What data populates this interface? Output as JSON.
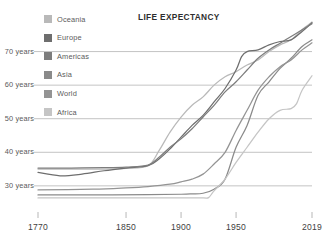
{
  "chart_data": {
    "type": "line",
    "title": "LIFE EXPECTANCY",
    "xlabel": "",
    "ylabel": "",
    "xlim": [
      1770,
      2019
    ],
    "ylim": [
      24,
      80
    ],
    "grid": true,
    "legend_position": "top-left",
    "x_ticks": [
      1770,
      1850,
      1900,
      1950,
      2019
    ],
    "x_tick_labels": [
      "1770",
      "1850",
      "1900",
      "1950",
      "2019"
    ],
    "y_ticks": [
      30,
      40,
      50,
      60,
      70
    ],
    "y_tick_labels": [
      "30 years",
      "40 years",
      "50 years",
      "60 years",
      "70 years"
    ],
    "series": [
      {
        "name": "Oceania",
        "color": "#b9b9b9",
        "x": [
          1770,
          1800,
          1830,
          1850,
          1870,
          1880,
          1890,
          1900,
          1910,
          1920,
          1930,
          1940,
          1950,
          1960,
          1970,
          1980,
          1990,
          2000,
          2010,
          2019
        ],
        "values": [
          35.0,
          35.0,
          35.0,
          35.2,
          36.0,
          40.5,
          46.0,
          50.5,
          54.0,
          56.5,
          60.0,
          62.5,
          64.0,
          66.0,
          67.5,
          70.0,
          72.0,
          73.5,
          76.5,
          78.8
        ]
      },
      {
        "name": "Europe",
        "color": "#6e6e6e",
        "x": [
          1770,
          1790,
          1810,
          1830,
          1850,
          1870,
          1880,
          1890,
          1900,
          1910,
          1920,
          1930,
          1940,
          1950,
          1955,
          1960,
          1970,
          1980,
          1990,
          2000,
          2010,
          2019
        ],
        "values": [
          34.0,
          33.0,
          33.5,
          34.5,
          35.3,
          36.0,
          38.0,
          41.0,
          44.5,
          48.0,
          51.0,
          55.0,
          59.0,
          64.5,
          68.5,
          70.0,
          70.5,
          72.0,
          73.0,
          73.5,
          76.0,
          78.6
        ]
      },
      {
        "name": "Americas",
        "color": "#7d7d7d",
        "x": [
          1770,
          1800,
          1830,
          1850,
          1870,
          1880,
          1890,
          1900,
          1910,
          1920,
          1930,
          1940,
          1950,
          1960,
          1970,
          1980,
          1990,
          2000,
          2010,
          2019
        ],
        "values": [
          35.3,
          35.3,
          35.4,
          35.6,
          36.2,
          38.5,
          41.5,
          44.0,
          47.0,
          50.5,
          54.0,
          58.0,
          61.0,
          64.5,
          68.0,
          70.5,
          72.5,
          74.5,
          76.5,
          78.3
        ]
      },
      {
        "name": "Asia",
        "color": "#8a8a8a",
        "x": [
          1770,
          1820,
          1870,
          1900,
          1910,
          1920,
          1930,
          1940,
          1950,
          1960,
          1970,
          1980,
          1990,
          2000,
          2010,
          2019
        ],
        "values": [
          27.3,
          27.3,
          27.4,
          27.5,
          27.6,
          27.8,
          29.0,
          32.0,
          41.5,
          48.0,
          57.0,
          61.0,
          65.0,
          68.0,
          71.5,
          73.5
        ]
      },
      {
        "name": "World",
        "color": "#949494",
        "x": [
          1770,
          1820,
          1850,
          1870,
          1890,
          1900,
          1910,
          1920,
          1930,
          1940,
          1950,
          1960,
          1970,
          1980,
          1990,
          2000,
          2010,
          2019
        ],
        "values": [
          28.8,
          29.0,
          29.4,
          29.8,
          30.5,
          31.2,
          32.0,
          33.5,
          36.5,
          40.0,
          46.5,
          52.5,
          58.5,
          62.5,
          65.5,
          67.5,
          70.5,
          72.6
        ]
      },
      {
        "name": "Africa",
        "color": "#c5c5c5",
        "x": [
          1770,
          1850,
          1900,
          1920,
          1925,
          1930,
          1940,
          1950,
          1960,
          1970,
          1980,
          1990,
          2000,
          2005,
          2010,
          2019
        ],
        "values": [
          26.4,
          26.4,
          26.4,
          26.4,
          26.5,
          28.5,
          32.0,
          37.0,
          41.5,
          46.0,
          50.0,
          52.5,
          53.0,
          54.5,
          58.5,
          62.8
        ]
      }
    ]
  },
  "legend": {
    "items": [
      {
        "label": "Oceania",
        "color": "#b9b9b9"
      },
      {
        "label": "Europe",
        "color": "#6e6e6e"
      },
      {
        "label": "Americas",
        "color": "#7d7d7d"
      },
      {
        "label": "Asia",
        "color": "#8a8a8a"
      },
      {
        "label": "World",
        "color": "#949494"
      },
      {
        "label": "Africa",
        "color": "#c5c5c5"
      }
    ]
  },
  "axes": {
    "y_labels": [
      "70 years",
      "60 years",
      "50 years",
      "40 years",
      "30 years"
    ],
    "x_labels": [
      "1770",
      "1850",
      "1900",
      "1950",
      "2019"
    ]
  },
  "title": "LIFE EXPECTANCY"
}
